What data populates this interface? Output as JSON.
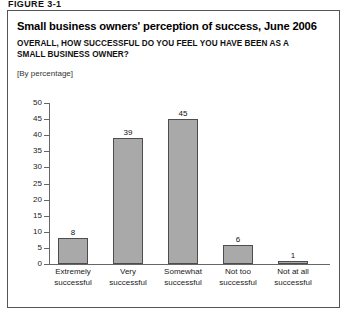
{
  "figure_label": "FIGURE 3-1",
  "title": "Small business owners' perception of success, June 2006",
  "subtitle": "OVERALL, HOW SUCCESSFUL DO YOU FEEL YOU HAVE BEEN AS A SMALL BUSINESS OWNER?",
  "units_note": "[By percentage]",
  "colors": {
    "bar_fill": "#a9a9a9",
    "bar_border": "#4d4d4d",
    "axis": "#666666",
    "frame": "#555555",
    "text": "#111111"
  },
  "chart_data": {
    "type": "bar",
    "title": "Small business owners' perception of success, June 2006",
    "subtitle": "OVERALL, HOW SUCCESSFUL DO YOU FEEL YOU HAVE BEEN AS A SMALL BUSINESS OWNER?",
    "units": "[By percentage]",
    "xlabel": "",
    "ylabel": "",
    "ylim": [
      0,
      50
    ],
    "ytick_step": 5,
    "yticks": [
      0,
      5,
      10,
      15,
      20,
      25,
      30,
      35,
      40,
      45,
      50
    ],
    "ytick_labels": [
      "0",
      "5",
      "10",
      "15",
      "20",
      "25",
      "30",
      "35",
      "40",
      "45",
      "50"
    ],
    "grid": false,
    "legend": false,
    "categories": [
      "Extremely successful",
      "Very successful",
      "Somewhat successful",
      "Not too successful",
      "Not at all successful"
    ],
    "category_lines": [
      [
        "Extremely",
        "successful"
      ],
      [
        "Very",
        "successful"
      ],
      [
        "Somewhat",
        "successful"
      ],
      [
        "Not too",
        "successful"
      ],
      [
        "Not at all",
        "successful"
      ]
    ],
    "values": [
      8,
      39,
      45,
      6,
      1
    ],
    "value_labels": [
      "8",
      "39",
      "45",
      "6",
      "1"
    ]
  }
}
